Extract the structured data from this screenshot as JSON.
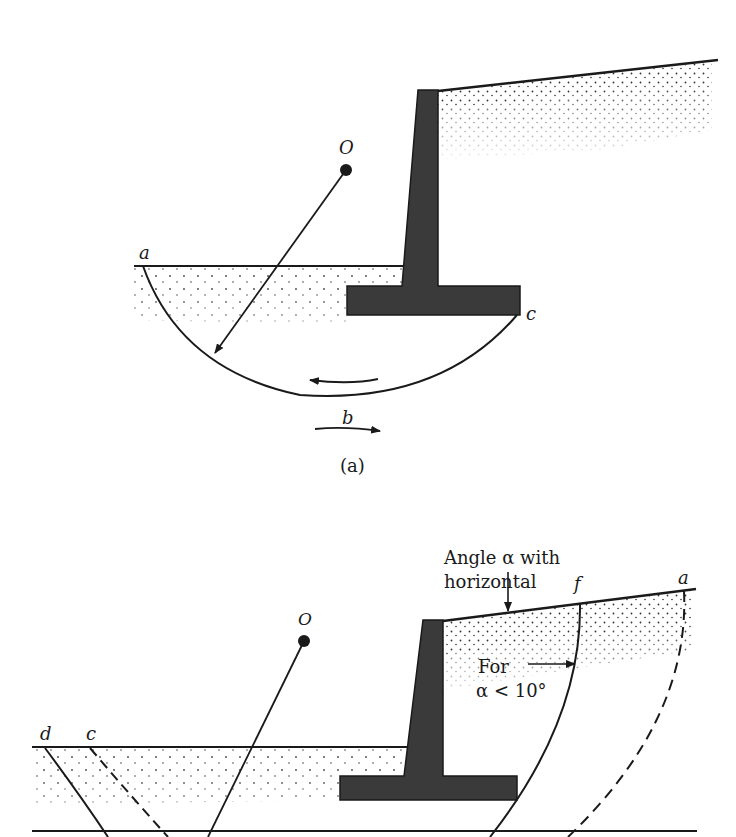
{
  "figure_a": {
    "caption": "(a)",
    "labels": {
      "center": "O",
      "point_a": "a",
      "point_b": "b",
      "point_c": "c"
    }
  },
  "figure_b": {
    "labels": {
      "center": "O",
      "point_a": "a",
      "point_c": "c",
      "point_d": "d",
      "point_f": "f"
    },
    "annotation_slope_line1": "Angle α with",
    "annotation_slope_line2": "horizontal",
    "annotation_alpha_line1": "For",
    "annotation_alpha_line2": "α < 10°"
  },
  "colors": {
    "ink": "#1a1a1a",
    "wall": "#3a3a3a",
    "background": "#ffffff"
  }
}
